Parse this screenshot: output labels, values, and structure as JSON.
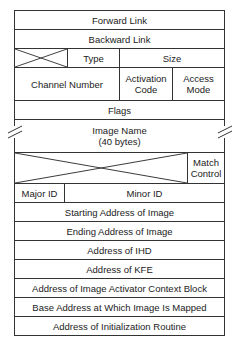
{
  "diagram": {
    "rows": {
      "forward_link": "Forward Link",
      "backward_link": "Backward Link",
      "type": "Type",
      "size": "Size",
      "channel_number": "Channel Number",
      "activation_code_1": "Activation",
      "activation_code_2": "Code",
      "access_mode_1": "Access",
      "access_mode_2": "Mode",
      "flags": "Flags",
      "image_name_1": "Image Name",
      "image_name_2": "(40 bytes)",
      "match_control_1": "Match",
      "match_control_2": "Control",
      "major_id": "Major ID",
      "minor_id": "Minor ID",
      "starting_address": "Starting Address of Image",
      "ending_address": "Ending Address of Image",
      "address_ihd": "Address of IHD",
      "address_kfe": "Address of KFE",
      "address_activator": "Address of Image Activator Context Block",
      "base_address": "Base Address at Which Image Is Mapped",
      "init_routine": "Address of Initialization Routine"
    },
    "line_color": "#333333"
  }
}
